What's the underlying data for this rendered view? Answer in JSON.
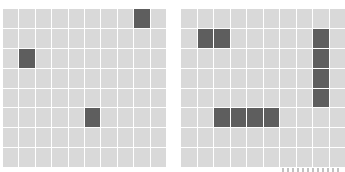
{
  "colors": {
    "empty_cell": "#d9d9d9",
    "filled_cell": "#5e5e5e",
    "grid_line": "#ffffff"
  },
  "boards": [
    {
      "name": "left-board",
      "rows": 8,
      "cols": 10,
      "filled": [
        [
          0,
          8
        ],
        [
          2,
          1
        ],
        [
          5,
          5
        ]
      ]
    },
    {
      "name": "right-board",
      "rows": 8,
      "cols": 10,
      "filled": [
        [
          1,
          1
        ],
        [
          1,
          2
        ],
        [
          1,
          8
        ],
        [
          2,
          8
        ],
        [
          3,
          8
        ],
        [
          4,
          8
        ],
        [
          5,
          2
        ],
        [
          5,
          3
        ],
        [
          5,
          4
        ],
        [
          5,
          5
        ]
      ]
    }
  ]
}
